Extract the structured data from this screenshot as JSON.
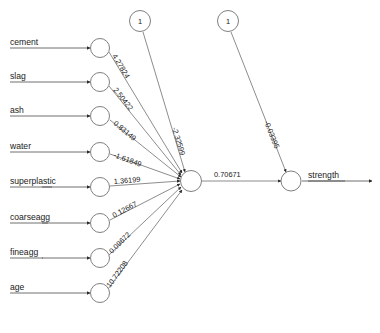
{
  "diagram": {
    "type": "feedforward-neural-network",
    "layers": {
      "input_count": 8,
      "hidden_count": 1,
      "output_count": 1
    }
  },
  "inputs": [
    {
      "label": "cement",
      "weight": "4.27824"
    },
    {
      "label": "slag",
      "weight": "2.50422"
    },
    {
      "label": "ash",
      "weight": "0.83149"
    },
    {
      "label": "water",
      "weight": "-1.61849"
    },
    {
      "label": "superplastic",
      "weight": "1.36199"
    },
    {
      "label": "coarseagg",
      "weight": "0.12667"
    },
    {
      "label": "fineagg",
      "weight": "0.09672"
    },
    {
      "label": "age",
      "weight": "10.72208"
    }
  ],
  "bias_nodes": [
    {
      "value": "1",
      "weight": "-2.32599",
      "target": "hidden"
    },
    {
      "value": "1",
      "weight": "-0.03395",
      "target": "output"
    }
  ],
  "hidden_to_output": {
    "weight": "0.70671"
  },
  "output": {
    "label": "strength"
  },
  "colors": {
    "stroke": "#808080",
    "text": "#1a1a1a",
    "background": "#ffffff"
  }
}
